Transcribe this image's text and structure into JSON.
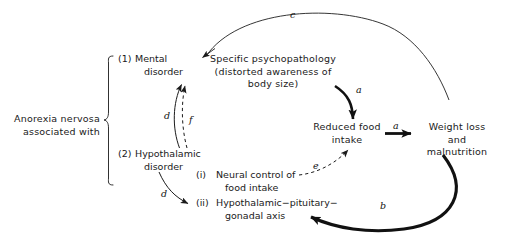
{
  "figure": {
    "type": "flow-diagram",
    "background": "#ffffff",
    "ink": "#1a1a1a"
  },
  "nodes": {
    "group_label": "Anorexia nervosa\nassociated with",
    "group_label_line1": "Anorexia nervosa",
    "group_label_line2": "associated with",
    "mental_disorder": {
      "marker": "(1)",
      "line1": "Mental",
      "line2": "disorder"
    },
    "hypothalamic_disorder": {
      "marker": "(2)",
      "line1": "Hypothalamic",
      "line2": "disorder"
    },
    "psychopathology": {
      "line1": "Specific psychopathology",
      "line2": "(distorted awareness of",
      "line3": "body size)"
    },
    "reduced_food_intake": {
      "line1": "Reduced food",
      "line2": "intake"
    },
    "weight_loss": {
      "line1": "Weight loss",
      "line2": "and",
      "line3": "malnutrition"
    },
    "neural_control": {
      "marker": "(i)",
      "line1": "Neural control of",
      "line2": "food intake"
    },
    "hpg_axis": {
      "marker": "(ii)",
      "line1": "Hypothalamic−pituitary−",
      "line2": "gonadal axis"
    }
  },
  "edges": [
    {
      "id": "edge-c",
      "label": "c",
      "from": "weight_loss",
      "to": "psychopathology",
      "style": "thin-solid-curve"
    },
    {
      "id": "edge-a-psych-to-intake",
      "label": "a",
      "from": "psychopathology",
      "to": "reduced_food_intake",
      "style": "thick-solid-curve"
    },
    {
      "id": "edge-a-intake-to-weightloss",
      "label": "a",
      "from": "reduced_food_intake",
      "to": "weight_loss",
      "style": "thick-solid-straight"
    },
    {
      "id": "edge-b",
      "label": "b",
      "from": "weight_loss",
      "to": "hpg_axis",
      "style": "thick-solid-curve"
    },
    {
      "id": "edge-d-left",
      "label": "d",
      "from": "hypothalamic_disorder",
      "to": "mental_disorder",
      "style": "thin-solid-curve"
    },
    {
      "id": "edge-f",
      "label": "f",
      "from": "hypothalamic_disorder",
      "to": "mental_disorder",
      "style": "thin-dashed-curve"
    },
    {
      "id": "edge-d-lower",
      "label": "d",
      "from": "hypothalamic_disorder",
      "to": "hpg_axis",
      "style": "thin-solid-curve"
    },
    {
      "id": "edge-e",
      "label": "e",
      "from": "neural_control",
      "to": "reduced_food_intake",
      "style": "thin-dashed-curve"
    }
  ],
  "edge_labels": {
    "c": "c",
    "a1": "a",
    "a2": "a",
    "b": "b",
    "d1": "d",
    "f": "f",
    "d2": "d",
    "e": "e"
  }
}
